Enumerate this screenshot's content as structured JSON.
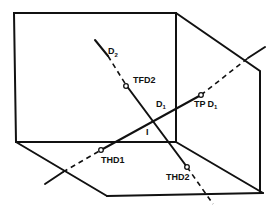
{
  "diagram": {
    "title": "",
    "lines": {
      "d1": {
        "label": "D",
        "subscript": "1"
      },
      "d2": {
        "label": "D",
        "subscript": "2"
      }
    },
    "points": {
      "intersection": {
        "label": "I"
      },
      "tfd2": {
        "label": "TFD2"
      },
      "tpd1": {
        "label_main": "T",
        "label_accent": "P",
        "label_suffix": "D",
        "label_sub": "1"
      },
      "thd1": {
        "label": "THD1"
      },
      "thd2": {
        "label": "THD2"
      }
    },
    "colors": {
      "stroke": "#111111",
      "background": "#ffffff"
    }
  }
}
